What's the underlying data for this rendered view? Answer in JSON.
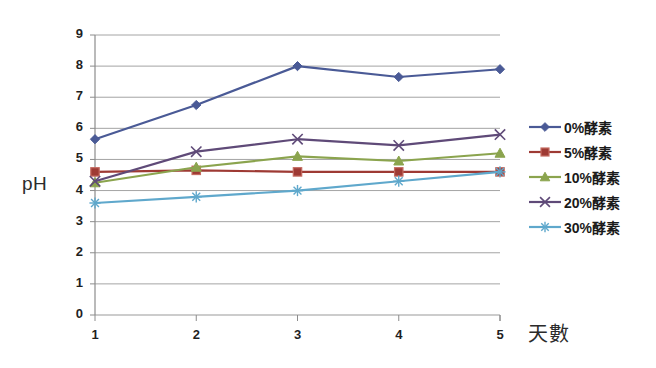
{
  "chart_data": {
    "type": "line",
    "title": "",
    "xlabel": "天數",
    "ylabel": "pH",
    "categories": [
      "1",
      "2",
      "3",
      "4",
      "5"
    ],
    "x": [
      1,
      2,
      3,
      4,
      5
    ],
    "ylim": [
      0,
      9
    ],
    "yticks": [
      "0",
      "1",
      "2",
      "3",
      "4",
      "5",
      "6",
      "7",
      "8",
      "9"
    ],
    "grid": true,
    "legend_position": "right",
    "series": [
      {
        "name": "0%酵素",
        "color": "#4a5a96",
        "marker": "diamond",
        "values": [
          5.65,
          6.75,
          8.0,
          7.65,
          7.9
        ]
      },
      {
        "name": "5%酵素",
        "color": "#9e3a34",
        "marker": "square",
        "values": [
          4.6,
          4.65,
          4.6,
          4.6,
          4.6
        ]
      },
      {
        "name": "10%酵素",
        "color": "#8ba44e",
        "marker": "triangle",
        "values": [
          4.25,
          4.75,
          5.1,
          4.95,
          5.2
        ]
      },
      {
        "name": "20%酵素",
        "color": "#5f4a78",
        "marker": "cross",
        "values": [
          4.3,
          5.25,
          5.65,
          5.45,
          5.8
        ]
      },
      {
        "name": "30%酵素",
        "color": "#5fa8cc",
        "marker": "asterisk",
        "values": [
          3.6,
          3.8,
          4.0,
          4.3,
          4.6
        ]
      }
    ]
  },
  "axes": {
    "y_title": "pH",
    "x_title": "天數",
    "y_tick_labels": [
      "9",
      "8",
      "7",
      "6",
      "5",
      "4",
      "3",
      "2",
      "1",
      "0"
    ],
    "x_tick_labels": [
      "1",
      "2",
      "3",
      "4",
      "5"
    ]
  },
  "legend": {
    "entries": [
      {
        "label": "0%酵素",
        "color": "#4a5a96",
        "marker": "diamond"
      },
      {
        "label": "5%酵素",
        "color": "#9e3a34",
        "marker": "square"
      },
      {
        "label": "10%酵素",
        "color": "#8ba44e",
        "marker": "triangle"
      },
      {
        "label": "20%酵素",
        "color": "#5f4a78",
        "marker": "cross"
      },
      {
        "label": "30%酵素",
        "color": "#5fa8cc",
        "marker": "asterisk"
      }
    ]
  },
  "colors": {
    "gridline": "#9a9a9a",
    "axis": "#8c8c8c",
    "background": "#ffffff",
    "text": "#1a1a1a"
  }
}
